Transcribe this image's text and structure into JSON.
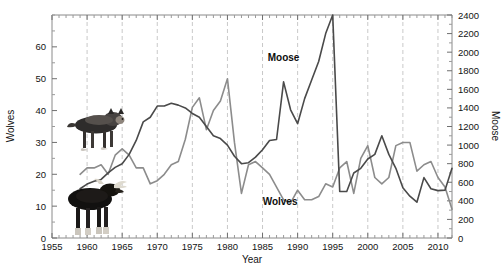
{
  "figure": {
    "background": "#ffffff",
    "wolf_icon_name": "wolf-illustration",
    "moose_icon_name": "moose-illustration"
  },
  "chart_data": {
    "type": "line",
    "title": "",
    "subtitle": "",
    "xlabel": "Year",
    "ylabel": "Wolves",
    "y2label": "Moose",
    "xlim": [
      1955,
      2012
    ],
    "ylim": [
      0,
      70
    ],
    "y2lim": [
      0,
      2400
    ],
    "grid": true,
    "grid_axis": "x",
    "grid_style": "dashed",
    "grid_years": [
      1960,
      1965,
      1970,
      1975,
      1980,
      1985,
      1990,
      1995,
      2000,
      2005,
      2010
    ],
    "legend_position": "inline-annotation",
    "xticks": [
      1955,
      1960,
      1965,
      1970,
      1975,
      1980,
      1985,
      1990,
      1995,
      2000,
      2005,
      2010
    ],
    "xticklabels": [
      "1955",
      "1960",
      "1965",
      "1970",
      "1975",
      "1980",
      "1985",
      "1990",
      "1995",
      "2000",
      "2005",
      "2010"
    ],
    "xtick_minor_step": 1,
    "yticks": [
      0,
      10,
      20,
      30,
      40,
      50,
      60
    ],
    "yticklabels": [
      "0",
      "10",
      "20",
      "30",
      "40",
      "50",
      "60"
    ],
    "ytick_minor_step": 5,
    "y2ticks": [
      0,
      200,
      400,
      600,
      800,
      1000,
      1200,
      1400,
      1600,
      1800,
      2000,
      2200,
      2400
    ],
    "y2ticklabels": [
      "0",
      "200",
      "400",
      "600",
      "800",
      "1000",
      "1200",
      "1400",
      "1600",
      "1800",
      "2000",
      "2200",
      "2400"
    ],
    "y2tick_minor_step": 100,
    "annotations": [
      {
        "name": "moose-series-label",
        "text": "Moose",
        "x": 1988,
        "y_axis": "right",
        "y": 1900
      },
      {
        "name": "wolves-series-label",
        "text": "Wolves",
        "x": 1987.5,
        "y_axis": "left",
        "y": 10.5
      }
    ],
    "series": [
      {
        "name": "Wolves",
        "axis": "left",
        "color": "#8c8c8c",
        "linewidth": 1.6,
        "x": [
          1959,
          1960,
          1961,
          1962,
          1963,
          1964,
          1965,
          1966,
          1967,
          1968,
          1969,
          1970,
          1971,
          1972,
          1973,
          1974,
          1975,
          1976,
          1977,
          1978,
          1979,
          1980,
          1981,
          1982,
          1983,
          1984,
          1985,
          1986,
          1987,
          1988,
          1989,
          1990,
          1991,
          1992,
          1993,
          1994,
          1995,
          1996,
          1997,
          1998,
          1999,
          2000,
          2001,
          2002,
          2003,
          2004,
          2005,
          2006,
          2007,
          2008,
          2009,
          2010,
          2011,
          2012
        ],
        "values": [
          20,
          22,
          22,
          23,
          20,
          26,
          28,
          26,
          22,
          22,
          17,
          18,
          20,
          23,
          24,
          31,
          41,
          44,
          34,
          40,
          43,
          50,
          30,
          14,
          23,
          24,
          22,
          20,
          16,
          12,
          11,
          15,
          12,
          12,
          13,
          17,
          16,
          22,
          24,
          14,
          25,
          29,
          19,
          17,
          19,
          29,
          30,
          30,
          21,
          23,
          24,
          19,
          16,
          9
        ]
      },
      {
        "name": "Moose",
        "axis": "right",
        "color": "#4a4a4a",
        "linewidth": 1.6,
        "x": [
          1959,
          1960,
          1961,
          1962,
          1963,
          1964,
          1965,
          1966,
          1967,
          1968,
          1969,
          1970,
          1971,
          1972,
          1973,
          1974,
          1975,
          1976,
          1977,
          1978,
          1979,
          1980,
          1981,
          1982,
          1983,
          1984,
          1985,
          1986,
          1987,
          1988,
          1989,
          1990,
          1991,
          1992,
          1993,
          1994,
          1995,
          1996,
          1997,
          1998,
          1999,
          2000,
          2001,
          2002,
          2003,
          2004,
          2005,
          2006,
          2007,
          2008,
          2009,
          2010,
          2011,
          2012
        ],
        "values": [
          530,
          580,
          610,
          630,
          700,
          760,
          800,
          900,
          1050,
          1250,
          1300,
          1420,
          1420,
          1450,
          1430,
          1400,
          1340,
          1300,
          1200,
          1100,
          1070,
          1000,
          880,
          800,
          810,
          870,
          950,
          1050,
          1060,
          1680,
          1380,
          1230,
          1500,
          1700,
          1900,
          2200,
          2400,
          500,
          500,
          700,
          750,
          850,
          900,
          1100,
          900,
          750,
          540,
          450,
          385,
          650,
          530,
          510,
          515,
          750
        ]
      }
    ]
  }
}
